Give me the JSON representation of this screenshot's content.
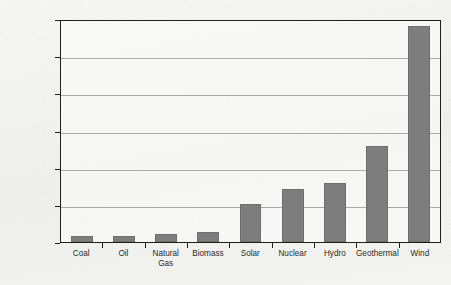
{
  "chart_data": {
    "type": "bar",
    "title": "",
    "xlabel": "",
    "ylabel": "% Efficiency",
    "ylim": [
      0,
      1200
    ],
    "yticks": [
      0,
      200,
      400,
      600,
      800,
      1000,
      1200
    ],
    "ytick_labels": [
      "0",
      "200",
      "400",
      "600",
      "800",
      "1,000",
      "1,200"
    ],
    "grid": true,
    "legend": "none",
    "bar_color": "#7d7d7d",
    "categories": [
      "Coal",
      "Oil",
      "Natural\nGas",
      "Biomass",
      "Solar",
      "Nuclear",
      "Hydro",
      "Geothermal",
      "Wind"
    ],
    "values": [
      30,
      30,
      42,
      55,
      205,
      285,
      315,
      515,
      1160
    ]
  }
}
